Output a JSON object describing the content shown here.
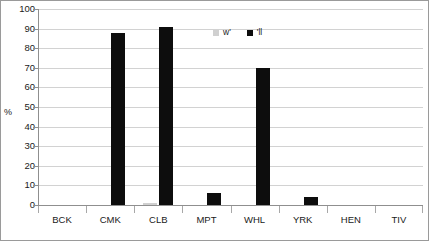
{
  "chart_data": {
    "type": "bar",
    "title": "",
    "subtitle": "",
    "xlabel": "",
    "ylabel": "%",
    "ylim": [
      0,
      100
    ],
    "ytick_step": 10,
    "ytick_labels": [
      "100",
      "90",
      "80",
      "70",
      "60",
      "50",
      "40",
      "30",
      "20",
      "10",
      "0"
    ],
    "ytick_values": [
      100,
      90,
      80,
      70,
      60,
      50,
      40,
      30,
      20,
      10,
      0
    ],
    "grid": true,
    "grid_axis": "y",
    "legend_position": "inside-upper-center",
    "categories": [
      "BCK",
      "CMK",
      "CLB",
      "MPT",
      "WHL",
      "YRK",
      "HEN",
      "TIV"
    ],
    "series": [
      {
        "name": "w'",
        "color": "#d0d0d0",
        "values": [
          0,
          0,
          1,
          0,
          0,
          0,
          0,
          0
        ]
      },
      {
        "name": "'ll",
        "color": "#0d0d0d",
        "values": [
          0,
          88,
          91,
          6,
          70,
          4,
          0,
          0
        ]
      }
    ]
  },
  "legend": {
    "entries": [
      {
        "label": "w'",
        "swatch": "legend-swatch-gray"
      },
      {
        "label": "'ll",
        "swatch": "legend-swatch-black"
      }
    ]
  },
  "axes": {
    "y_title": "%"
  }
}
